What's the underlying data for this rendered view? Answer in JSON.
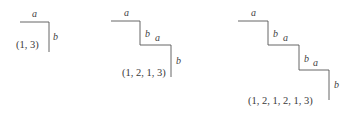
{
  "canvas": {
    "width": 359,
    "height": 122,
    "background": "#ffffff",
    "line_color": "#555555",
    "text_color": "#3a3a3a",
    "line_width": 0.9
  },
  "figures": [
    {
      "id": "figure-1",
      "tuple": "(1, 3)",
      "tuple_pos": {
        "x": 16,
        "y": 40
      },
      "path": "M 20 22 L 49 22 L 49 52",
      "edges": [
        {
          "label": "a",
          "orientation": "horizontal",
          "x": 32,
          "y": 9
        },
        {
          "label": "b",
          "orientation": "vertical",
          "x": 53,
          "y": 32
        }
      ]
    },
    {
      "id": "figure-2",
      "tuple": "(1, 2, 1, 3)",
      "tuple_pos": {
        "x": 122,
        "y": 68
      },
      "path": "M 111 21 L 140 21 L 140 45 L 171 45 L 171 77",
      "edges": [
        {
          "label": "a",
          "orientation": "horizontal",
          "x": 124,
          "y": 8
        },
        {
          "label": "b",
          "orientation": "vertical",
          "x": 145,
          "y": 29
        },
        {
          "label": "a",
          "orientation": "horizontal",
          "x": 155,
          "y": 33
        },
        {
          "label": "b",
          "orientation": "vertical",
          "x": 176,
          "y": 56
        }
      ]
    },
    {
      "id": "figure-3",
      "tuple": "(1, 2, 1, 2, 1, 3)",
      "tuple_pos": {
        "x": 248,
        "y": 96
      },
      "path": "M 238 21 L 268 21 L 268 45 L 299 45 L 299 70 L 329 70 L 329 100",
      "edges": [
        {
          "label": "a",
          "orientation": "horizontal",
          "x": 251,
          "y": 8
        },
        {
          "label": "b",
          "orientation": "vertical",
          "x": 273,
          "y": 29
        },
        {
          "label": "a",
          "orientation": "horizontal",
          "x": 283,
          "y": 33
        },
        {
          "label": "b",
          "orientation": "vertical",
          "x": 304,
          "y": 54
        },
        {
          "label": "a",
          "orientation": "horizontal",
          "x": 313,
          "y": 58
        },
        {
          "label": "b",
          "orientation": "vertical",
          "x": 334,
          "y": 80
        }
      ]
    }
  ]
}
